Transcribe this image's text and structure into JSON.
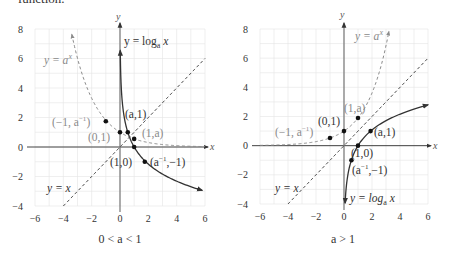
{
  "page": {
    "top_text_fragment": "function."
  },
  "chart_data": [
    {
      "type": "line",
      "title": "",
      "caption": "0 < a < 1",
      "xlabel": "x",
      "ylabel": "y",
      "xlim": [
        -6,
        6
      ],
      "ylim": [
        -4,
        8
      ],
      "xticks": [
        "-6",
        "-4",
        "-2",
        "0",
        "2",
        "4",
        "6"
      ],
      "yticks": [
        "8",
        "6",
        "4",
        "2",
        "0",
        "-2",
        "-4"
      ],
      "xtick_values": [
        -6,
        -4,
        -2,
        0,
        2,
        4,
        6
      ],
      "ytick_values": [
        8,
        6,
        4,
        2,
        0,
        -2,
        -4
      ],
      "grid": true,
      "base_a": 0.55,
      "series": [
        {
          "name": "y = log_a x",
          "style": "solid",
          "color": "#333333",
          "func": "log",
          "xrange": [
            0.02,
            5.8
          ]
        },
        {
          "name": "y = a^x",
          "style": "dashed",
          "color": "#8a8a8a",
          "func": "exp",
          "xrange": [
            -3.4,
            6
          ]
        },
        {
          "name": "y = x",
          "style": "dashed",
          "color": "#333333",
          "func": "identity",
          "xrange": [
            -4,
            6
          ]
        }
      ],
      "points": [
        {
          "label": "(-1, a^-1)",
          "x": -1,
          "y": 1.75,
          "color": "#111"
        },
        {
          "label": "(0,1)",
          "x": 0,
          "y": 1,
          "color": "#111"
        },
        {
          "label": "(a,1)",
          "x": 0.55,
          "y": 1,
          "color": "#111"
        },
        {
          "label": "(1,a)",
          "x": 1,
          "y": 0.55,
          "color": "#111"
        },
        {
          "label": "(1,0)",
          "x": 1,
          "y": 0,
          "color": "#111"
        },
        {
          "label": "(a^-1, -1)",
          "x": 1.75,
          "y": -1,
          "color": "#111"
        }
      ],
      "annotations": {
        "log_label": "y = log",
        "log_sub": "a",
        "log_x": " x",
        "exp_label": "y = a",
        "exp_sup": "x",
        "identity_label": "y = x",
        "pt_neg1": "(−1, a",
        "pt_neg1_sup": "−1",
        "pt_neg1_close": ")",
        "pt_01": "(0,1)",
        "pt_a1": "(a,1)",
        "pt_1a": "(1,a)",
        "pt_10": "(1,0)",
        "pt_ainv": "(a",
        "pt_ainv_sup": "−1",
        "pt_ainv_close": ",−1)"
      }
    },
    {
      "type": "line",
      "title": "",
      "caption": "a > 1",
      "xlabel": "x",
      "ylabel": "y",
      "xlim": [
        -6,
        6
      ],
      "ylim": [
        -4,
        8
      ],
      "xticks": [
        "-6",
        "-4",
        "-2",
        "0",
        "2",
        "4",
        "6"
      ],
      "yticks": [
        "8",
        "6",
        "4",
        "2",
        "0",
        "-2",
        "-4"
      ],
      "xtick_values": [
        -6,
        -4,
        -2,
        0,
        2,
        4,
        6
      ],
      "ytick_values": [
        8,
        6,
        4,
        2,
        0,
        -2,
        -4
      ],
      "grid": true,
      "base_a": 1.9,
      "series": [
        {
          "name": "y = log_a x",
          "style": "solid",
          "color": "#333333",
          "func": "log",
          "xrange": [
            0.08,
            6
          ]
        },
        {
          "name": "y = a^x",
          "style": "dashed",
          "color": "#8a8a8a",
          "func": "exp",
          "xrange": [
            -6,
            3.3
          ]
        },
        {
          "name": "y = x",
          "style": "dashed",
          "color": "#333333",
          "func": "identity",
          "xrange": [
            -4,
            6
          ]
        }
      ],
      "points": [
        {
          "label": "(-1, a^-1)",
          "x": -1,
          "y": 0.53,
          "color": "#111"
        },
        {
          "label": "(0,1)",
          "x": 0,
          "y": 1,
          "color": "#111"
        },
        {
          "label": "(1,a)",
          "x": 1,
          "y": 1.9,
          "color": "#111"
        },
        {
          "label": "(a,1)",
          "x": 1.9,
          "y": 1,
          "color": "#111"
        },
        {
          "label": "(1,0)",
          "x": 1,
          "y": 0,
          "color": "#111"
        },
        {
          "label": "(a^-1, -1)",
          "x": 0.53,
          "y": -1,
          "color": "#111"
        }
      ],
      "annotations": {
        "log_label": "y = log",
        "log_sub": "a",
        "log_x": " x",
        "exp_label": "y = a",
        "exp_sup": "x",
        "identity_label": "y = x",
        "pt_neg1": "(−1, a",
        "pt_neg1_sup": "−1",
        "pt_neg1_close": ")",
        "pt_01": "(0,1)",
        "pt_a1": "(a,1)",
        "pt_1a": "(1,a)",
        "pt_10": "(1,0)",
        "pt_ainv": "(a",
        "pt_ainv_sup": "−1",
        "pt_ainv_close": ",−1)"
      }
    }
  ]
}
